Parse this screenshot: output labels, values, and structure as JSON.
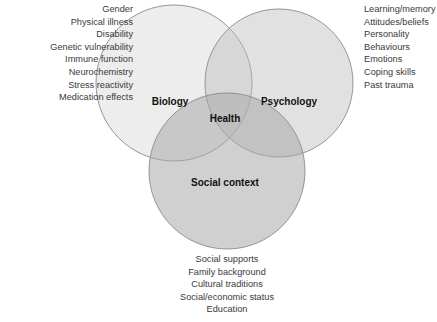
{
  "diagram": {
    "circles": [
      {
        "id": "biology",
        "label": "Biology",
        "cx": 174,
        "cy": 83,
        "r": 78
      },
      {
        "id": "psychology",
        "label": "Psychology",
        "cx": 279,
        "cy": 83,
        "r": 74
      },
      {
        "id": "social",
        "label": "Social context",
        "cx": 227,
        "cy": 171,
        "r": 78
      }
    ],
    "center_label": "Health",
    "colors": {
      "fill": "#cccccc",
      "stroke": "#8a8a8a",
      "text": "#3a3a3a"
    }
  },
  "lists": {
    "biology": [
      "Gender",
      "Physical illness",
      "Disability",
      "Genetic vulnerability",
      "Immune function",
      "Neurochemistry",
      "Stress reactivity",
      "Medication effects"
    ],
    "psychology": [
      "Learning/memory",
      "Attitudes/beliefs",
      "Personality",
      "Behaviours",
      "Emotions",
      "Coping skills",
      "Past trauma"
    ],
    "social": [
      "Social supports",
      "Family background",
      "Cultural traditions",
      "Social/economic status",
      "Education"
    ]
  }
}
